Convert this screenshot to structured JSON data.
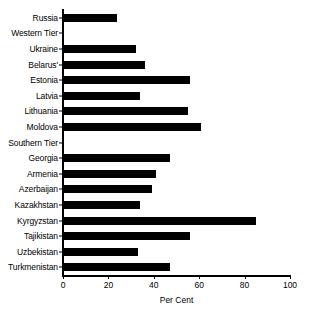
{
  "chart_data": {
    "type": "bar",
    "orientation": "horizontal",
    "title": "",
    "xlabel": "Per Cent",
    "ylabel": "",
    "xlim": [
      0,
      100
    ],
    "xticks": [
      0,
      20,
      40,
      60,
      80,
      100
    ],
    "grid": false,
    "legend": false,
    "bar_color": "#000000",
    "categories": [
      "Russia",
      "Western Tier",
      "Ukraine",
      "Belarus'",
      "Estonia",
      "Latvia",
      "Lithuania",
      "Moldova",
      "Southern Tier",
      "Georgia",
      "Armenia",
      "Azerbaijan",
      "Kazakhstan",
      "Kyrgyzstan",
      "Tajikistan",
      "Uzbekistan",
      "Turkmenistan"
    ],
    "values": [
      24,
      null,
      32,
      36,
      56,
      34,
      55,
      61,
      null,
      47,
      41,
      39,
      34,
      85,
      56,
      33,
      47
    ],
    "group_headers": [
      "Western Tier",
      "Southern Tier"
    ]
  },
  "axis": {
    "x_title": "Per Cent",
    "tick_labels": [
      "0",
      "20",
      "40",
      "60",
      "80",
      "100"
    ]
  },
  "rows": [
    {
      "label": "Russia",
      "value": 24
    },
    {
      "label": "Western Tier",
      "value": null
    },
    {
      "label": "Ukraine",
      "value": 32
    },
    {
      "label": "Belarus'",
      "value": 36
    },
    {
      "label": "Estonia",
      "value": 56
    },
    {
      "label": "Latvia",
      "value": 34
    },
    {
      "label": "Lithuania",
      "value": 55
    },
    {
      "label": "Moldova",
      "value": 61
    },
    {
      "label": "Southern Tier",
      "value": null
    },
    {
      "label": "Georgia",
      "value": 47
    },
    {
      "label": "Armenia",
      "value": 41
    },
    {
      "label": "Azerbaijan",
      "value": 39
    },
    {
      "label": "Kazakhstan",
      "value": 34
    },
    {
      "label": "Kyrgyzstan",
      "value": 85
    },
    {
      "label": "Tajikistan",
      "value": 56
    },
    {
      "label": "Uzbekistan",
      "value": 33
    },
    {
      "label": "Turkmenistan",
      "value": 47
    }
  ]
}
